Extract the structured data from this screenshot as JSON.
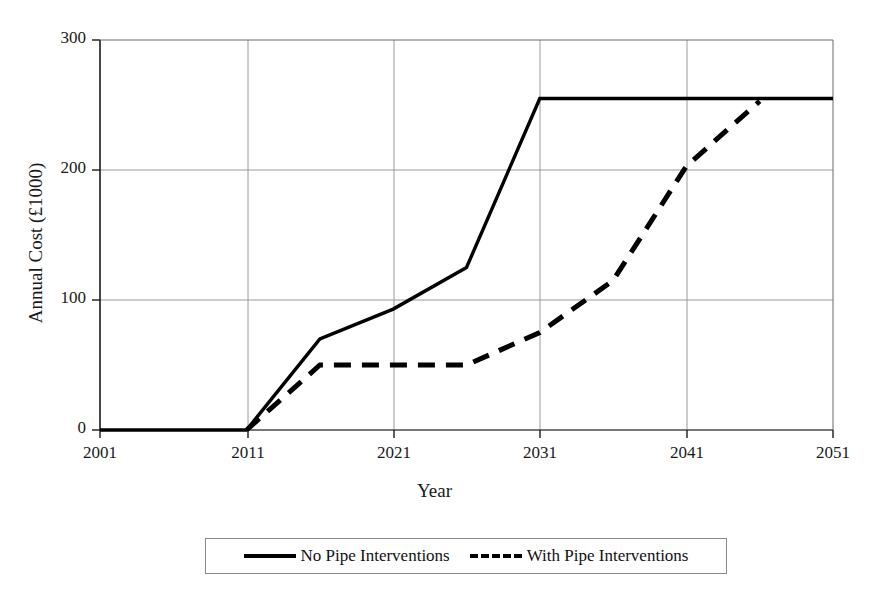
{
  "chart_data": {
    "type": "line",
    "title": "",
    "xlabel": "Year",
    "ylabel": "Annual Cost (£1000)",
    "xlim": [
      2001,
      2051
    ],
    "ylim": [
      0,
      300
    ],
    "xticks": [
      "2001",
      "2011",
      "2021",
      "2031",
      "2041",
      "2051"
    ],
    "yticks": [
      "0",
      "100",
      "200",
      "300"
    ],
    "grid": true,
    "legend_position": "below-axes",
    "series": [
      {
        "name": "No Pipe Interventions",
        "style": "solid",
        "color": "#000000",
        "points": [
          {
            "x": 2001,
            "y": 0
          },
          {
            "x": 2011,
            "y": 0
          },
          {
            "x": 2016,
            "y": 70
          },
          {
            "x": 2021,
            "y": 93
          },
          {
            "x": 2026,
            "y": 125
          },
          {
            "x": 2031,
            "y": 255
          },
          {
            "x": 2051,
            "y": 255
          }
        ]
      },
      {
        "name": "With Pipe Interventions",
        "style": "dashed",
        "color": "#000000",
        "points": [
          {
            "x": 2011,
            "y": 0
          },
          {
            "x": 2016,
            "y": 50
          },
          {
            "x": 2026,
            "y": 50
          },
          {
            "x": 2031,
            "y": 75
          },
          {
            "x": 2036,
            "y": 115
          },
          {
            "x": 2041,
            "y": 203
          },
          {
            "x": 2046,
            "y": 253
          }
        ]
      }
    ]
  },
  "legend": {
    "entries": [
      {
        "label": "No Pipe Interventions",
        "style": "solid"
      },
      {
        "label": "With Pipe Interventions",
        "style": "dashed"
      }
    ]
  }
}
